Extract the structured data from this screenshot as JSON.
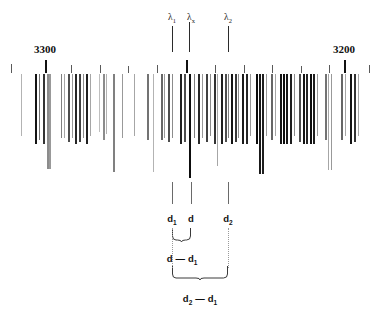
{
  "figure": {
    "type": "spectrogram-plate-diagram"
  },
  "scale_labels": [
    {
      "text": "3300",
      "x": 45,
      "y": 44,
      "tick_x": 45
    },
    {
      "text": "3200",
      "x": 344,
      "y": 44,
      "tick_x": 344
    }
  ],
  "wavelength_markers": [
    {
      "label": "λ",
      "sub": "1",
      "x": 172,
      "y": 13
    },
    {
      "label": "λ",
      "sub": "x",
      "x": 191,
      "y": 13
    },
    {
      "label": "λ",
      "sub": "2",
      "x": 228,
      "y": 13
    }
  ],
  "distance_markers": [
    {
      "label": "d",
      "sub": "1",
      "x": 172,
      "y": 214
    },
    {
      "label": "d",
      "sub": "",
      "x": 191,
      "y": 214
    },
    {
      "label": "d",
      "sub": "2",
      "x": 228,
      "y": 214
    }
  ],
  "brace_labels": [
    {
      "text_a": "d",
      "sub_a": "",
      "dash": "—",
      "text_b": "d",
      "sub_b": "1",
      "x": 182,
      "y": 254,
      "from_x": 172,
      "to_x": 191
    },
    {
      "text_a": "d",
      "sub_a": "2",
      "dash": "—",
      "text_b": "d",
      "sub_b": "1",
      "x": 200,
      "y": 294,
      "from_x": 172,
      "to_x": 228
    }
  ],
  "scale_ticks": [
    {
      "x": 11,
      "h": 9,
      "major": false
    },
    {
      "x": 45,
      "h": 13,
      "major": true
    },
    {
      "x": 71,
      "h": 8,
      "major": false
    },
    {
      "x": 100,
      "h": 8,
      "major": false
    },
    {
      "x": 128,
      "h": 7,
      "major": false
    },
    {
      "x": 157,
      "h": 8,
      "major": false
    },
    {
      "x": 186,
      "h": 13,
      "major": true
    },
    {
      "x": 215,
      "h": 8,
      "major": false
    },
    {
      "x": 244,
      "h": 8,
      "major": false
    },
    {
      "x": 272,
      "h": 8,
      "major": false
    },
    {
      "x": 301,
      "h": 7,
      "major": false
    },
    {
      "x": 329,
      "h": 8,
      "major": false
    },
    {
      "x": 344,
      "h": 13,
      "major": true
    },
    {
      "x": 369,
      "h": 8,
      "major": false
    }
  ],
  "upper_pointers": [
    {
      "x": 172,
      "y": 26,
      "h": 26
    },
    {
      "x": 189,
      "y": 22,
      "h": 30
    },
    {
      "x": 228,
      "y": 26,
      "h": 26
    }
  ],
  "lower_pointers": [
    {
      "x": 172,
      "y": 182,
      "h": 22
    },
    {
      "x": 191,
      "y": 182,
      "h": 22
    },
    {
      "x": 228,
      "y": 182,
      "h": 22
    }
  ],
  "chart_data": {
    "type": "bar",
    "title": "",
    "xlabel": "Wavelength (Å)",
    "ylabel": "",
    "xlim": [
      3320,
      3180
    ],
    "grid": false,
    "legend": null,
    "note": "Each entry is one spectral line: x = horizontal pixel position, w = line width px, d = darkness 0-1, len = vertical length px measured from top of the spectrum strip",
    "lines": [
      {
        "x": 21,
        "w": 1,
        "d": 0.3,
        "len": 62
      },
      {
        "x": 35,
        "w": 2,
        "d": 0.92,
        "len": 70
      },
      {
        "x": 39,
        "w": 1,
        "d": 0.55,
        "len": 66
      },
      {
        "x": 43,
        "w": 2,
        "d": 0.8,
        "len": 70
      },
      {
        "x": 47,
        "w": 2,
        "d": 0.45,
        "len": 95
      },
      {
        "x": 49,
        "w": 2,
        "d": 0.4,
        "len": 95
      },
      {
        "x": 61,
        "w": 1,
        "d": 0.5,
        "len": 64
      },
      {
        "x": 64,
        "w": 1,
        "d": 0.35,
        "len": 64
      },
      {
        "x": 68,
        "w": 2,
        "d": 0.7,
        "len": 68
      },
      {
        "x": 72,
        "w": 1,
        "d": 0.4,
        "len": 64
      },
      {
        "x": 75,
        "w": 2,
        "d": 0.85,
        "len": 70
      },
      {
        "x": 79,
        "w": 2,
        "d": 0.75,
        "len": 68
      },
      {
        "x": 83,
        "w": 1,
        "d": 0.45,
        "len": 64
      },
      {
        "x": 86,
        "w": 2,
        "d": 0.88,
        "len": 70
      },
      {
        "x": 90,
        "w": 1,
        "d": 0.35,
        "len": 62
      },
      {
        "x": 99,
        "w": 1,
        "d": 0.25,
        "len": 58
      },
      {
        "x": 103,
        "w": 2,
        "d": 0.45,
        "len": 66
      },
      {
        "x": 106,
        "w": 1,
        "d": 0.3,
        "len": 60
      },
      {
        "x": 113,
        "w": 2,
        "d": 0.5,
        "len": 98
      },
      {
        "x": 122,
        "w": 1,
        "d": 0.4,
        "len": 64
      },
      {
        "x": 134,
        "w": 1,
        "d": 0.35,
        "len": 62
      },
      {
        "x": 147,
        "w": 2,
        "d": 0.55,
        "len": 66
      },
      {
        "x": 153,
        "w": 1,
        "d": 0.3,
        "len": 98
      },
      {
        "x": 161,
        "w": 2,
        "d": 0.6,
        "len": 66
      },
      {
        "x": 164,
        "w": 1,
        "d": 0.4,
        "len": 64
      },
      {
        "x": 168,
        "w": 2,
        "d": 0.7,
        "len": 68
      },
      {
        "x": 172,
        "w": 1,
        "d": 0.45,
        "len": 64
      },
      {
        "x": 180,
        "w": 2,
        "d": 0.88,
        "len": 70
      },
      {
        "x": 184,
        "w": 2,
        "d": 0.7,
        "len": 68
      },
      {
        "x": 189,
        "w": 2,
        "d": 0.95,
        "len": 104
      },
      {
        "x": 194,
        "w": 1,
        "d": 0.5,
        "len": 64
      },
      {
        "x": 198,
        "w": 2,
        "d": 0.85,
        "len": 70
      },
      {
        "x": 202,
        "w": 1,
        "d": 0.4,
        "len": 64
      },
      {
        "x": 206,
        "w": 2,
        "d": 0.75,
        "len": 68
      },
      {
        "x": 210,
        "w": 1,
        "d": 0.45,
        "len": 62
      },
      {
        "x": 214,
        "w": 2,
        "d": 0.8,
        "len": 70
      },
      {
        "x": 217,
        "w": 1,
        "d": 0.35,
        "len": 92
      },
      {
        "x": 221,
        "w": 2,
        "d": 0.88,
        "len": 70
      },
      {
        "x": 225,
        "w": 2,
        "d": 0.7,
        "len": 68
      },
      {
        "x": 228,
        "w": 1,
        "d": 0.5,
        "len": 64
      },
      {
        "x": 231,
        "w": 2,
        "d": 0.92,
        "len": 70
      },
      {
        "x": 235,
        "w": 2,
        "d": 0.78,
        "len": 68
      },
      {
        "x": 238,
        "w": 1,
        "d": 0.45,
        "len": 64
      },
      {
        "x": 242,
        "w": 2,
        "d": 0.9,
        "len": 70
      },
      {
        "x": 246,
        "w": 2,
        "d": 0.85,
        "len": 70
      },
      {
        "x": 250,
        "w": 1,
        "d": 0.4,
        "len": 62
      },
      {
        "x": 256,
        "w": 2,
        "d": 0.95,
        "len": 70
      },
      {
        "x": 259,
        "w": 2,
        "d": 0.9,
        "len": 100
      },
      {
        "x": 262,
        "w": 2,
        "d": 0.88,
        "len": 100
      },
      {
        "x": 266,
        "w": 1,
        "d": 0.4,
        "len": 62
      },
      {
        "x": 271,
        "w": 2,
        "d": 0.6,
        "len": 66
      },
      {
        "x": 275,
        "w": 1,
        "d": 0.35,
        "len": 62
      },
      {
        "x": 280,
        "w": 2,
        "d": 0.92,
        "len": 70
      },
      {
        "x": 283,
        "w": 2,
        "d": 0.95,
        "len": 70
      },
      {
        "x": 286,
        "w": 2,
        "d": 0.9,
        "len": 70
      },
      {
        "x": 290,
        "w": 2,
        "d": 0.88,
        "len": 70
      },
      {
        "x": 294,
        "w": 1,
        "d": 0.45,
        "len": 62
      },
      {
        "x": 299,
        "w": 2,
        "d": 0.7,
        "len": 68
      },
      {
        "x": 303,
        "w": 2,
        "d": 0.92,
        "len": 70
      },
      {
        "x": 306,
        "w": 2,
        "d": 0.85,
        "len": 70
      },
      {
        "x": 310,
        "w": 2,
        "d": 0.95,
        "len": 70
      },
      {
        "x": 313,
        "w": 2,
        "d": 0.88,
        "len": 70
      },
      {
        "x": 317,
        "w": 1,
        "d": 0.4,
        "len": 62
      },
      {
        "x": 325,
        "w": 2,
        "d": 0.55,
        "len": 66
      },
      {
        "x": 328,
        "w": 1,
        "d": 0.35,
        "len": 96
      },
      {
        "x": 331,
        "w": 1,
        "d": 0.4,
        "len": 96
      },
      {
        "x": 341,
        "w": 2,
        "d": 0.6,
        "len": 66
      },
      {
        "x": 345,
        "w": 1,
        "d": 0.35,
        "len": 62
      },
      {
        "x": 350,
        "w": 2,
        "d": 0.92,
        "len": 70
      },
      {
        "x": 354,
        "w": 2,
        "d": 0.8,
        "len": 68
      },
      {
        "x": 358,
        "w": 1,
        "d": 0.35,
        "len": 62
      }
    ]
  }
}
